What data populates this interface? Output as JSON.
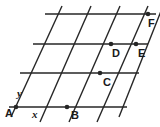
{
  "figure": {
    "name": "parallelogram-grid-figure",
    "width": 160,
    "height": 127,
    "background_color": "#ffffff",
    "line_color": "#262626",
    "text_color": "#1a1a1a",
    "line_width": 1.4,
    "dot_radius": 2.3
  },
  "horizontal_lines": [
    {
      "name": "horizontal-line-1",
      "x1": 45,
      "y1": 14,
      "x2": 156,
      "y2": 14
    },
    {
      "name": "horizontal-line-2",
      "x1": 33,
      "y1": 44,
      "x2": 148,
      "y2": 44
    },
    {
      "name": "horizontal-line-3",
      "x1": 20,
      "y1": 73,
      "x2": 139,
      "y2": 73
    },
    {
      "name": "horizontal-line-4",
      "x1": 9,
      "y1": 107,
      "x2": 127,
      "y2": 107
    }
  ],
  "slanted_lines": [
    {
      "name": "slanted-line-1",
      "x1": 11,
      "y1": 117,
      "x2": 62,
      "y2": 6
    },
    {
      "name": "slanted-line-2",
      "x1": 40,
      "y1": 122,
      "x2": 91,
      "y2": 6
    },
    {
      "name": "slanted-line-3",
      "x1": 69,
      "y1": 122,
      "x2": 120,
      "y2": 6
    },
    {
      "name": "slanted-line-4",
      "x1": 97,
      "y1": 122,
      "x2": 148,
      "y2": 6
    },
    {
      "name": "slanted-line-5",
      "x1": 119,
      "y1": 117,
      "x2": 163,
      "y2": 6
    }
  ],
  "points": [
    {
      "name": "point-a",
      "label": "A",
      "x": 16,
      "y": 107,
      "label_x": 5,
      "label_y": 108
    },
    {
      "name": "point-b",
      "label": "B",
      "x": 67,
      "y": 107,
      "label_x": 71,
      "label_y": 110
    },
    {
      "name": "point-c",
      "label": "C",
      "x": 100,
      "y": 73,
      "label_x": 103,
      "label_y": 77
    },
    {
      "name": "point-d",
      "label": "D",
      "x": 111,
      "y": 44,
      "label_x": 112,
      "label_y": 48
    },
    {
      "name": "point-e",
      "label": "E",
      "x": 136,
      "y": 44,
      "label_x": 138,
      "label_y": 48
    },
    {
      "name": "point-f",
      "label": "F",
      "x": 148,
      "y": 14,
      "label_x": 148,
      "label_y": 18
    }
  ],
  "ray_labels": [
    {
      "name": "ray-label-y",
      "label": "y",
      "x": 17,
      "y": 88
    },
    {
      "name": "ray-label-x",
      "label": "x",
      "x": 32,
      "y": 109
    }
  ]
}
